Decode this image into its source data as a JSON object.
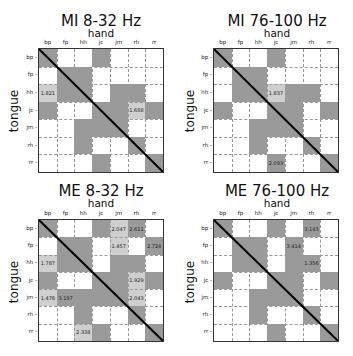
{
  "colors": {
    "sig": "#9a9a9a",
    "light": "#cfcfcf",
    "none": "#ffffff",
    "diag": "#000000"
  },
  "labels": [
    "bp",
    "fp",
    "hh",
    "jc",
    "jm",
    "rh",
    "rr"
  ],
  "chart_data": [
    {
      "type": "heatmap",
      "title": "MI 8-32 Hz",
      "xlabel": "hand",
      "ylabel": "tongue",
      "rows": [
        "bp",
        "fp",
        "hh",
        "jc",
        "jm",
        "rh",
        "rr"
      ],
      "cols": [
        "bp",
        "fp",
        "hh",
        "jc",
        "jm",
        "rh",
        "rr"
      ],
      "cells": [
        [
          "g",
          "w",
          "w",
          "g",
          "w",
          "w",
          "w"
        ],
        [
          "w",
          "g",
          "g",
          "w",
          "w",
          "w",
          "w"
        ],
        [
          "l",
          "g",
          "g",
          "w",
          "g",
          "g",
          "w"
        ],
        [
          "g",
          "w",
          "w",
          "g",
          "g",
          "l",
          "g"
        ],
        [
          "w",
          "w",
          "g",
          "g",
          "g",
          "w",
          "w"
        ],
        [
          "w",
          "w",
          "g",
          "w",
          "w",
          "g",
          "w"
        ],
        [
          "w",
          "w",
          "w",
          "g",
          "w",
          "w",
          "g"
        ]
      ],
      "values": [
        [
          "",
          "",
          "",
          "",
          "",
          "",
          ""
        ],
        [
          "",
          "",
          "",
          "",
          "",
          "",
          ""
        ],
        [
          "1.821",
          "",
          "",
          "",
          "",
          "",
          ""
        ],
        [
          "",
          "",
          "",
          "",
          "",
          "1.688",
          ""
        ],
        [
          "",
          "",
          "",
          "",
          "",
          "",
          ""
        ],
        [
          "",
          "",
          "",
          "",
          "",
          "",
          ""
        ],
        [
          "",
          "",
          "",
          "",
          "",
          "",
          ""
        ]
      ]
    },
    {
      "type": "heatmap",
      "title": "MI 76-100 Hz",
      "xlabel": "hand",
      "ylabel": "tongue",
      "rows": [
        "bp",
        "fp",
        "hh",
        "jc",
        "jm",
        "rh",
        "rr"
      ],
      "cols": [
        "bp",
        "fp",
        "hh",
        "jc",
        "jm",
        "rh",
        "rr"
      ],
      "cells": [
        [
          "g",
          "w",
          "w",
          "g",
          "w",
          "w",
          "w"
        ],
        [
          "w",
          "g",
          "g",
          "w",
          "w",
          "w",
          "w"
        ],
        [
          "w",
          "g",
          "g",
          "l",
          "g",
          "g",
          "w"
        ],
        [
          "g",
          "w",
          "w",
          "g",
          "g",
          "w",
          "g"
        ],
        [
          "w",
          "w",
          "g",
          "g",
          "g",
          "w",
          "w"
        ],
        [
          "w",
          "w",
          "g",
          "w",
          "w",
          "g",
          "w"
        ],
        [
          "w",
          "w",
          "w",
          "g",
          "w",
          "w",
          "g"
        ]
      ],
      "values": [
        [
          "",
          "",
          "",
          "",
          "",
          "",
          ""
        ],
        [
          "",
          "",
          "",
          "",
          "",
          "",
          ""
        ],
        [
          "",
          "",
          "",
          "1.837",
          "",
          "",
          ""
        ],
        [
          "",
          "",
          "",
          "",
          "",
          "",
          ""
        ],
        [
          "",
          "",
          "",
          "",
          "",
          "",
          ""
        ],
        [
          "",
          "",
          "",
          "",
          "",
          "",
          ""
        ],
        [
          "",
          "",
          "",
          "2.093",
          "",
          "",
          ""
        ]
      ]
    },
    {
      "type": "heatmap",
      "title": "ME 8-32 Hz",
      "xlabel": "hand",
      "ylabel": "tongue",
      "rows": [
        "bp",
        "fp",
        "hh",
        "jc",
        "jm",
        "rh",
        "rr"
      ],
      "cols": [
        "bp",
        "fp",
        "hh",
        "jc",
        "jm",
        "rh",
        "rr"
      ],
      "cells": [
        [
          "g",
          "w",
          "w",
          "g",
          "l",
          "g",
          "w"
        ],
        [
          "w",
          "g",
          "g",
          "w",
          "l",
          "w",
          "g"
        ],
        [
          "l",
          "g",
          "g",
          "w",
          "g",
          "g",
          "w"
        ],
        [
          "g",
          "w",
          "w",
          "g",
          "g",
          "l",
          "g"
        ],
        [
          "l",
          "g",
          "g",
          "g",
          "g",
          "l",
          "w"
        ],
        [
          "w",
          "w",
          "g",
          "w",
          "w",
          "g",
          "w"
        ],
        [
          "w",
          "w",
          "l",
          "g",
          "w",
          "w",
          "g"
        ]
      ],
      "values": [
        [
          "",
          "",
          "",
          "",
          "2.047",
          "2.611",
          ""
        ],
        [
          "",
          "",
          "",
          "",
          "1.457",
          "",
          "2.724"
        ],
        [
          "1.787",
          "",
          "",
          "",
          "",
          "",
          ""
        ],
        [
          "",
          "",
          "",
          "",
          "",
          "1.929",
          ""
        ],
        [
          "1.478",
          "3.197",
          "",
          "",
          "",
          "2.043",
          ""
        ],
        [
          "",
          "",
          "",
          "",
          "",
          "",
          ""
        ],
        [
          "",
          "",
          "2.338",
          "",
          "",
          "",
          ""
        ]
      ]
    },
    {
      "type": "heatmap",
      "title": "ME 76-100 Hz",
      "xlabel": "hand",
      "ylabel": "tongue",
      "rows": [
        "bp",
        "fp",
        "hh",
        "jc",
        "jm",
        "rh",
        "rr"
      ],
      "cols": [
        "bp",
        "fp",
        "hh",
        "jc",
        "jm",
        "rh",
        "rr"
      ],
      "cells": [
        [
          "g",
          "w",
          "w",
          "g",
          "w",
          "g",
          "w"
        ],
        [
          "w",
          "g",
          "g",
          "w",
          "g",
          "w",
          "w"
        ],
        [
          "w",
          "g",
          "g",
          "w",
          "g",
          "g",
          "w"
        ],
        [
          "g",
          "w",
          "w",
          "g",
          "g",
          "w",
          "g"
        ],
        [
          "w",
          "w",
          "g",
          "g",
          "g",
          "w",
          "w"
        ],
        [
          "w",
          "w",
          "g",
          "w",
          "w",
          "g",
          "w"
        ],
        [
          "w",
          "w",
          "w",
          "g",
          "w",
          "w",
          "g"
        ]
      ],
      "values": [
        [
          "",
          "",
          "",
          "",
          "",
          "3.143",
          ""
        ],
        [
          "",
          "",
          "",
          "",
          "3.414",
          "",
          ""
        ],
        [
          "",
          "",
          "",
          "",
          "",
          "1.356",
          ""
        ],
        [
          "",
          "",
          "",
          "",
          "",
          "",
          ""
        ],
        [
          "",
          "",
          "",
          "",
          "",
          "",
          ""
        ],
        [
          "",
          "",
          "",
          "",
          "",
          "",
          ""
        ],
        [
          "",
          "",
          "",
          "",
          "",
          "",
          ""
        ]
      ]
    }
  ]
}
